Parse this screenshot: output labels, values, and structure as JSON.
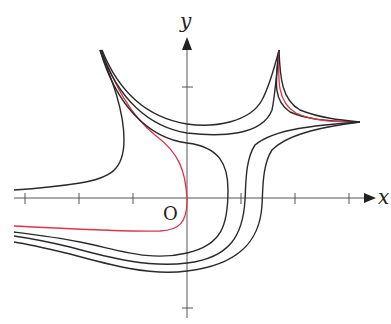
{
  "figure": {
    "x_axis_label": "x",
    "y_axis_label": "y",
    "origin_label": "O",
    "colors": {
      "axis": "#555555",
      "curve": "#2a2a2a",
      "highlight_curve": "#e0334a",
      "background": "#ffffff"
    },
    "x_ticks_px": [
      25,
      79,
      133,
      241,
      295,
      349
    ],
    "y_ticks_px": [
      87,
      308
    ],
    "curve_count": 11,
    "highlighted_curves": 3
  }
}
